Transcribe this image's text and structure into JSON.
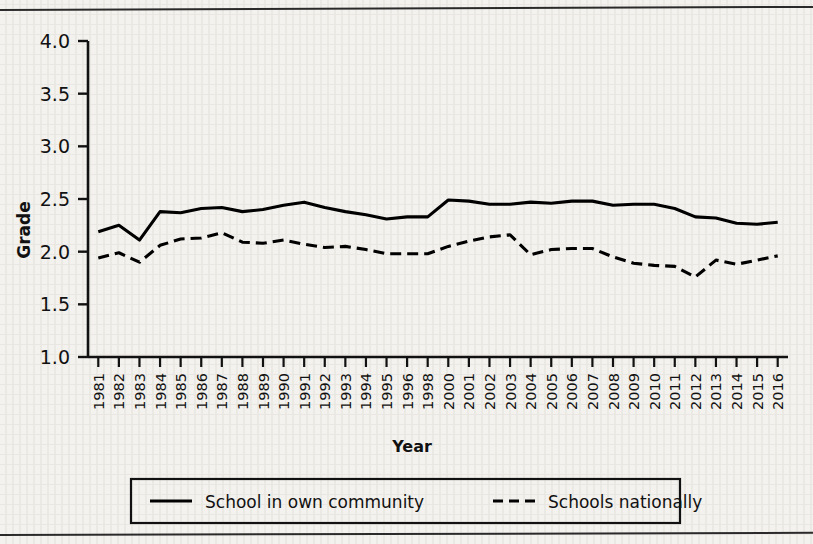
{
  "chart_data": {
    "type": "line",
    "title": "",
    "xlabel": "Year",
    "ylabel": "Grade",
    "ylim": [
      1.0,
      4.0
    ],
    "yticks": [
      "1.0",
      "1.5",
      "2.0",
      "2.5",
      "3.0",
      "3.5",
      "4.0"
    ],
    "ytick_values": [
      1.0,
      1.5,
      2.0,
      2.5,
      3.0,
      3.5,
      4.0
    ],
    "grid": false,
    "legend_position": "bottom",
    "categories": [
      "1981",
      "1982",
      "1983",
      "1984",
      "1985",
      "1986",
      "1987",
      "1988",
      "1989",
      "1990",
      "1991",
      "1992",
      "1993",
      "1994",
      "1995",
      "1996",
      "1998",
      "2000",
      "2001",
      "2002",
      "2003",
      "2004",
      "2005",
      "2006",
      "2007",
      "2008",
      "2009",
      "2010",
      "2011",
      "2012",
      "2013",
      "2014",
      "2015",
      "2016"
    ],
    "series": [
      {
        "name": "School in own community",
        "style": "solid",
        "color": "#000000",
        "values": [
          2.19,
          2.25,
          2.11,
          2.38,
          2.37,
          2.41,
          2.42,
          2.38,
          2.4,
          2.44,
          2.47,
          2.42,
          2.38,
          2.35,
          2.31,
          2.33,
          2.33,
          2.49,
          2.48,
          2.45,
          2.45,
          2.47,
          2.46,
          2.48,
          2.48,
          2.44,
          2.45,
          2.45,
          2.41,
          2.33,
          2.32,
          2.27,
          2.26,
          2.28
        ]
      },
      {
        "name": "Schools nationally",
        "style": "dashed",
        "color": "#000000",
        "values": [
          1.94,
          1.99,
          1.9,
          2.06,
          2.12,
          2.13,
          2.18,
          2.09,
          2.08,
          2.11,
          2.07,
          2.04,
          2.05,
          2.02,
          1.98,
          1.98,
          1.98,
          2.05,
          2.1,
          2.14,
          2.16,
          1.97,
          2.02,
          2.03,
          2.03,
          1.95,
          1.89,
          1.87,
          1.86,
          1.76,
          1.92,
          1.88,
          1.92,
          1.96
        ]
      }
    ]
  },
  "legend": {
    "items": [
      {
        "label": "School in own community",
        "style": "solid"
      },
      {
        "label": "Schools nationally",
        "style": "dashed"
      }
    ]
  },
  "axes": {
    "y_title": "Grade",
    "x_title": "Year"
  }
}
